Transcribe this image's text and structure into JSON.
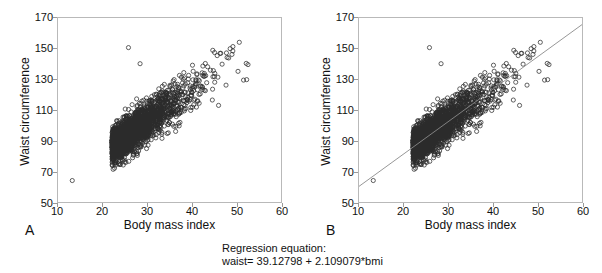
{
  "figure": {
    "caption_line1": "Regression equation:",
    "caption_line2": "waist= 39.12798 + 2.109079*bmi"
  },
  "panels": [
    {
      "letter": "A",
      "xlabel": "Body mass index",
      "ylabel": "Waist circumference",
      "show_regression_line": false
    },
    {
      "letter": "B",
      "xlabel": "Body mass index",
      "ylabel": "Waist circumference",
      "show_regression_line": true
    }
  ],
  "chart_data": {
    "type": "scatter",
    "title": "",
    "xlabel": "Body mass index",
    "ylabel": "Waist circumference",
    "xlim": [
      10,
      60
    ],
    "ylim": [
      50,
      170
    ],
    "xticks": [
      10,
      20,
      30,
      40,
      50,
      60
    ],
    "yticks": [
      50,
      70,
      90,
      110,
      130,
      150,
      170
    ],
    "grid": false,
    "legend": null,
    "marker": "open-circle",
    "marker_color": "#2b2b2b",
    "marker_size_px": 2.1,
    "n_points": 2400,
    "distribution": {
      "x_mean": 27.6,
      "x_sd": 4.6,
      "x_skew": 0.55,
      "y_given_x_intercept": 39.12798,
      "y_given_x_slope": 2.109079,
      "residual_sd": 6.4,
      "correlation": 0.84
    },
    "regression": {
      "intercept": 39.12798,
      "slope": 2.109079,
      "equation": "waist= 39.12798 + 2.109079*bmi",
      "line_color": "#8a8a8a",
      "x_from": 10,
      "x_to": 60,
      "y_from": 60.2,
      "y_to": 165.7,
      "drawn_in_panels": [
        "B"
      ]
    },
    "outliers": [
      {
        "x": 25.8,
        "y": 150.7
      },
      {
        "x": 28.4,
        "y": 140.2
      },
      {
        "x": 13.2,
        "y": 64.0
      },
      {
        "x": 48.6,
        "y": 150.0
      },
      {
        "x": 49.2,
        "y": 148.5
      },
      {
        "x": 52.3,
        "y": 129.8
      },
      {
        "x": 51.6,
        "y": 129.5
      },
      {
        "x": 52.6,
        "y": 139.6
      },
      {
        "x": 52.2,
        "y": 140.4
      },
      {
        "x": 45.1,
        "y": 147.5
      },
      {
        "x": 46.0,
        "y": 113.0
      },
      {
        "x": 44.6,
        "y": 116.5
      }
    ]
  }
}
